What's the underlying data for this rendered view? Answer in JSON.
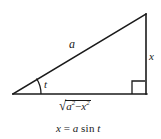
{
  "figure": {
    "type": "right-triangle-trig-substitution",
    "background_color": "#ffffff",
    "stroke_color": "#1a1a1a",
    "text_color": "#1a1a1a",
    "vertices": {
      "bottom_left": [
        13,
        94
      ],
      "bottom_right": [
        146,
        94
      ],
      "apex": [
        146,
        14
      ]
    },
    "angle_arc": {
      "at_vertex": "bottom_left",
      "label": "t",
      "radius": 28
    },
    "right_angle_marker": {
      "at_vertex": "bottom_right",
      "size": 9
    }
  },
  "labels": {
    "hypotenuse": "a",
    "angle": "t",
    "opposite_side": "x",
    "adjacent_side": {
      "radical_sign": "√",
      "radicand_base_1": "a",
      "radicand_exp_1": "2",
      "operator": "−",
      "radicand_base_2": "x",
      "radicand_exp_2": "2",
      "plain_text": "√(a² − x²)"
    }
  },
  "equation": {
    "lhs": "x",
    "relation": "=",
    "coefficient": "a",
    "function": "sin",
    "argument": "t",
    "plain_text": "x = a sin t"
  }
}
